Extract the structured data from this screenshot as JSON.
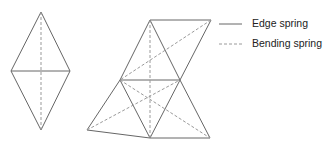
{
  "legend": {
    "items": [
      {
        "label": "Edge spring",
        "style": "solid"
      },
      {
        "label": "Bending spring",
        "style": "dashed"
      }
    ]
  },
  "colors": {
    "edge": "#666666",
    "bending": "#9a9a9a"
  }
}
